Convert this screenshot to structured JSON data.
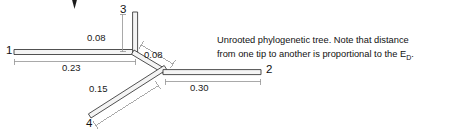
{
  "figure": {
    "type": "unrooted-phylogenetic-tree",
    "caption": {
      "line1": "Unrooted phylogenetic tree. Note that distance",
      "line2_pre": "from one tip to another is proportional to the E",
      "line2_sub": "D",
      "line2_post": "."
    },
    "tips": [
      {
        "id": "tip-1",
        "label": "1",
        "branch_length": "0.23",
        "direction": "left-horizontal"
      },
      {
        "id": "tip-3",
        "label": "3",
        "branch_length": "0.08",
        "direction": "up-vertical"
      },
      {
        "id": "tip-2",
        "label": "2",
        "branch_length": "0.30",
        "direction": "right-horizontal"
      },
      {
        "id": "tip-4",
        "label": "4",
        "branch_length": "0.15",
        "direction": "down-left-diagonal"
      }
    ],
    "internal_branches": [
      {
        "id": "internal-branch",
        "label": "0.08",
        "direction": "down-right-diagonal"
      }
    ],
    "distance_labels": {
      "d1": "0.23",
      "d3": "0.08",
      "d_internal": "0.08",
      "d4": "0.15",
      "d2": "0.30"
    },
    "colors": {
      "branch_stroke": "#3d3d3d",
      "branch_fill": "#f4f4f4",
      "measure_stroke": "#9a9a9a",
      "text": "#111111",
      "background": "#ffffff"
    },
    "cursor": {
      "name": "arrow-cursor-artifact"
    }
  }
}
